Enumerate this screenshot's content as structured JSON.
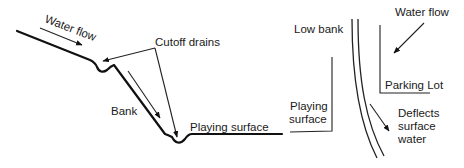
{
  "left_diagram": {
    "title": "Bank cross-section with cutoff drains",
    "labels": {
      "water_flow": "Water flow",
      "cutoff_drains": "Cutoff drains",
      "bank": "Bank",
      "playing_surface": "Playing surface"
    }
  },
  "right_diagram": {
    "title": "Plan view with low bank deflecting water",
    "labels": {
      "water_flow": "Water flow",
      "low_bank": "Low bank",
      "parking_lot": "Parking Lot",
      "playing_surface_line1": "Playing",
      "playing_surface_line2": "surface",
      "deflects_line1": "Deflects",
      "deflects_line2": "surface",
      "deflects_line3": "water"
    }
  },
  "colors": {
    "line": "#111111",
    "text": "#1a1a1a",
    "background": "#ffffff"
  }
}
